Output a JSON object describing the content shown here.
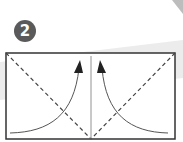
{
  "diagram": {
    "step_number": "2",
    "colors": {
      "badge": "#5a5a5a",
      "outline": "#333333",
      "band": "#e6e6e6",
      "corner": "#bdbdbd"
    },
    "elements": [
      {
        "type": "rectangle",
        "role": "paper-sheet"
      },
      {
        "type": "dashed-line",
        "role": "fold-line-left"
      },
      {
        "type": "dashed-line",
        "role": "fold-line-right"
      },
      {
        "type": "solid-line",
        "role": "center-crease"
      },
      {
        "type": "curved-arrow",
        "role": "fold-arrow-left"
      },
      {
        "type": "curved-arrow",
        "role": "fold-arrow-right"
      }
    ]
  }
}
